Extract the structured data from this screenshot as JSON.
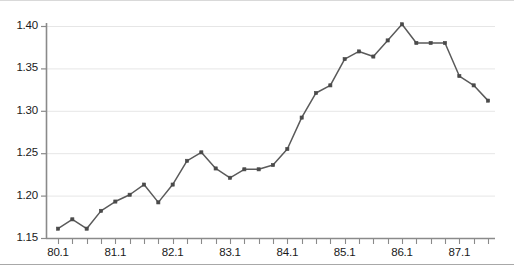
{
  "chart_data": {
    "type": "line",
    "title": "",
    "xlabel": "",
    "ylabel": "",
    "ylim": [
      1.15,
      1.4
    ],
    "yticks": [
      1.15,
      1.2,
      1.25,
      1.3,
      1.35,
      1.4
    ],
    "ytick_labels": [
      "1.15",
      "1.20",
      "1.25",
      "1.30",
      "1.35",
      "1.40"
    ],
    "xtick_labels": [
      "80.1",
      "81.1",
      "82.1",
      "83.1",
      "84.1",
      "85.1",
      "86.1",
      "87.1"
    ],
    "xtick_indices": [
      0,
      4,
      8,
      12,
      16,
      20,
      24,
      28
    ],
    "grid": "horizontal",
    "legend": "none",
    "marker": "square",
    "line_color": "#5a5a5a",
    "marker_color": "#4a4a4a",
    "grid_color": "#e6e6e6",
    "axis_color": "#808080",
    "n_points": 31,
    "x": [
      "80.1",
      "80.2",
      "80.3",
      "80.4",
      "81.1",
      "81.2",
      "81.3",
      "81.4",
      "82.1",
      "82.2",
      "82.3",
      "82.4",
      "83.1",
      "83.2",
      "83.3",
      "83.4",
      "84.1",
      "84.2",
      "84.3",
      "84.4",
      "85.1",
      "85.2",
      "85.3",
      "85.4",
      "86.1",
      "86.2",
      "86.3",
      "86.4",
      "87.1",
      "87.2",
      "87.3"
    ],
    "values": [
      1.161,
      1.172,
      1.161,
      1.182,
      1.193,
      1.201,
      1.213,
      1.192,
      1.213,
      1.241,
      1.251,
      1.232,
      1.221,
      1.231,
      1.231,
      1.236,
      1.255,
      1.292,
      1.321,
      1.33,
      1.361,
      1.37,
      1.364,
      1.383,
      1.402,
      1.38,
      1.38,
      1.38,
      1.341,
      1.33,
      1.312
    ]
  }
}
